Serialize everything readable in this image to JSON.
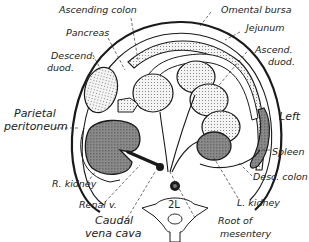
{
  "diagram": {
    "labels": {
      "ascending_colon": "Ascending colon",
      "omental_bursa": "Omental bursa",
      "pancreas": "Pancreas",
      "jejunum": "Jejunum",
      "descend_duod_1": "Descend.",
      "descend_duod_2": "duod.",
      "ascend_duod_1": "Ascend.",
      "ascend_duod_2": "duod.",
      "parietal_1": "Parietal",
      "parietal_2": "peritoneum",
      "left": "Left",
      "spleen": "Spleen",
      "desc_colon": "Desc. colon",
      "r_kidney": "R. kidney",
      "l_kidney": "L. kidney",
      "renal_v": "Renal v.",
      "caudal_1": "Caudal",
      "caudal_2": "vena cava",
      "root_1": "Root of",
      "root_2": "mesentery",
      "vertebra": "2L"
    },
    "colors": {
      "outline": "#1a1a1a",
      "stipple": "#d8d8d8",
      "kidney_fill": "#7a7a7a",
      "background": "#ffffff"
    }
  }
}
